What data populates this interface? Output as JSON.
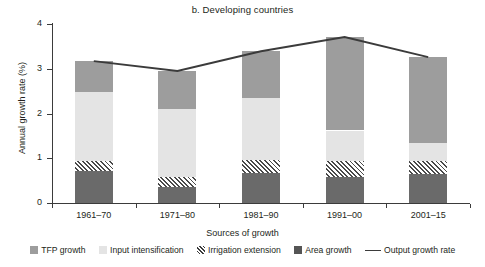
{
  "chart_data": {
    "type": "bar",
    "title": "b. Developing countries",
    "xlabel": "Sources of growth",
    "ylabel": "Annual growth rate (%)",
    "ylim": [
      0,
      4
    ],
    "yticks": [
      "0",
      "1",
      "2",
      "3",
      "4"
    ],
    "grid": false,
    "legend_position": "bottom",
    "stacked": true,
    "categories": [
      "1961–70",
      "1971–80",
      "1981–90",
      "1991–00",
      "2001–15"
    ],
    "series": [
      {
        "name": "Area growth",
        "values": [
          0.72,
          0.35,
          0.67,
          0.58,
          0.64
        ]
      },
      {
        "name": "Irrigation extension",
        "values": [
          0.21,
          0.22,
          0.28,
          0.35,
          0.3
        ]
      },
      {
        "name": "Input intensification",
        "values": [
          1.54,
          1.52,
          1.4,
          0.69,
          0.41
        ]
      },
      {
        "name": "TFP growth",
        "values": [
          0.7,
          0.86,
          1.04,
          2.09,
          1.91
        ]
      }
    ],
    "line_series": {
      "name": "Output growth rate",
      "values": [
        3.17,
        2.95,
        3.39,
        3.71,
        3.26
      ]
    }
  },
  "legend": {
    "items": [
      {
        "label": "TFP growth",
        "swatch": "square-medium-gray-icon",
        "color": "#9d9d9d"
      },
      {
        "label": "Input intensification",
        "swatch": "square-light-gray-icon",
        "color": "#e4e4e4"
      },
      {
        "label": "Irrigation extension",
        "swatch": "square-hatched-icon",
        "color": "#3b3b3b"
      },
      {
        "label": "Area growth",
        "swatch": "square-dark-gray-icon",
        "color": "#555555"
      },
      {
        "label": "Output growth rate",
        "swatch": "line-segment-icon",
        "color": "#3b3b3b"
      }
    ]
  }
}
